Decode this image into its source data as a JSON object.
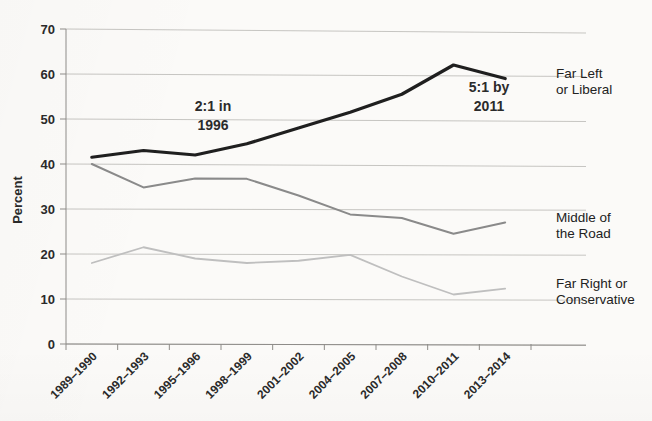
{
  "chart_data": {
    "type": "line",
    "title": "",
    "xlabel": "",
    "ylabel": "Percent",
    "ylim": [
      0,
      70
    ],
    "ytick_step": 10,
    "yticks": [
      "0",
      "10",
      "20",
      "30",
      "40",
      "50",
      "60",
      "70"
    ],
    "grid": true,
    "legend_position": "right-of-plot-inline",
    "categories": [
      "1989–1990",
      "1992–1993",
      "1995–1996",
      "1998–1999",
      "2001–2002",
      "2004–2005",
      "2007–2008",
      "2010–2011",
      "2013–2014"
    ],
    "series": [
      {
        "name": "Far Left or Liberal",
        "label_line1": "Far Left",
        "label_line2": "or Liberal",
        "color": "#1f1f1f",
        "width": 3.2,
        "values": [
          41.5,
          43.0,
          42.0,
          44.5,
          48.0,
          51.5,
          55.5,
          62.0,
          59.0
        ]
      },
      {
        "name": "Middle of the Road",
        "label_line1": "Middle of",
        "label_line2": "the Road",
        "color": "#8a8a8a",
        "width": 2.0,
        "values": [
          40.0,
          34.8,
          36.8,
          36.7,
          33.0,
          28.8,
          28.0,
          24.5,
          27.0
        ]
      },
      {
        "name": "Far Right or Conservative",
        "label_line1": "Far Right or",
        "label_line2": "Conservative",
        "color": "#bfbfbf",
        "width": 1.8,
        "values": [
          18.0,
          21.5,
          19.0,
          18.0,
          18.5,
          19.8,
          15.0,
          11.0,
          12.3
        ]
      }
    ],
    "annotations": [
      {
        "name": "ratio-1996",
        "line1": "2:1 in",
        "line2": "1996",
        "at_category": "1995–1996"
      },
      {
        "name": "ratio-2011",
        "line1": "5:1 by",
        "line2": "2011",
        "at_category": "2010–2011"
      }
    ]
  },
  "colors": {
    "background": "#fbfaf8",
    "grid": "#b9b7b4",
    "axis": "#8e8c89",
    "text": "#2a2a2a"
  }
}
